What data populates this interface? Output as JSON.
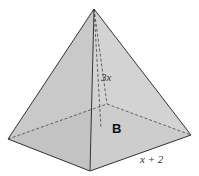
{
  "diagram": {
    "type": "square pyramid",
    "height_label": "3x",
    "base_label": "B",
    "edge_label": "x + 2",
    "colors": {
      "face_left": "#bdbdbd",
      "face_right": "#c9c9c9",
      "base": "#d6d6d6",
      "stroke": "#333333"
    },
    "vertices": {
      "apex": [
        94,
        9
      ],
      "left": [
        8,
        139
      ],
      "front": [
        90,
        171
      ],
      "right": [
        191,
        135
      ],
      "back": [
        107,
        104
      ],
      "base_center": [
        101,
        128
      ]
    }
  }
}
